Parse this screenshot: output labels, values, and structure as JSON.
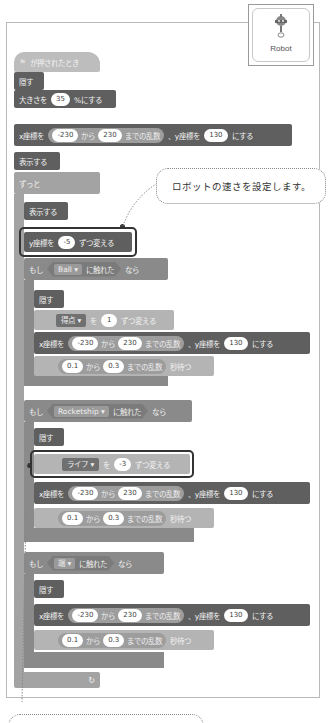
{
  "sprite": {
    "name": "Robot",
    "icon": "robot-icon"
  },
  "callout_top": {
    "text": "ロボットの速さを設定します。",
    "ruby": [
      "はや",
      "せってい"
    ]
  },
  "script": {
    "hat": {
      "flag_icon": "green-flag-icon",
      "label": "が押されたとき"
    },
    "hide1": "隠す",
    "size": {
      "label": "大きさを",
      "value": "35",
      "suffix": "%にする"
    },
    "goto1": {
      "x_label": "x座標を",
      "from": "-230",
      "kara": "から",
      "to": "230",
      "made": "までの乱数",
      "y_label": "、y座標を",
      "y": "130",
      "suffix": "にする"
    },
    "show1": "表示する",
    "forever": "ずっと",
    "show2": "表示する",
    "change_y": {
      "label": "y座標を",
      "value": "-5",
      "suffix": "ずつ変える"
    },
    "if1": {
      "moshi": "もし",
      "target": "Ball",
      "touching": "に触れた",
      "nara": "なら",
      "hide": "隠す",
      "change_var": {
        "var": "得点",
        "wo": "を",
        "value": "1",
        "suffix": "ずつ変える"
      },
      "goto": {
        "x_label": "x座標を",
        "from": "-230",
        "kara": "から",
        "to": "230",
        "made": "までの乱数",
        "y_label": "、y座標を",
        "y": "130",
        "suffix": "にする"
      },
      "wait": {
        "from": "0.1",
        "kara": "から",
        "to": "0.3",
        "made": "までの乱数",
        "suffix": "秒待つ"
      }
    },
    "if2": {
      "moshi": "もし",
      "target": "Rocketship",
      "touching": "に触れた",
      "nara": "なら",
      "hide": "隠す",
      "change_var": {
        "var": "ライフ",
        "wo": "を",
        "value": "-3",
        "suffix": "ずつ変える"
      },
      "goto": {
        "x_label": "x座標を",
        "from": "-230",
        "kara": "から",
        "to": "230",
        "made": "までの乱数",
        "y_label": "、y座標を",
        "y": "130",
        "suffix": "にする"
      },
      "wait": {
        "from": "0.1",
        "kara": "から",
        "to": "0.3",
        "made": "までの乱数",
        "suffix": "秒待つ"
      }
    },
    "if3": {
      "moshi": "もし",
      "target": "端",
      "touching": "に触れた",
      "nara": "なら",
      "hide": "隠す",
      "goto": {
        "x_label": "x座標を",
        "from": "-230",
        "kara": "から",
        "to": "230",
        "made": "までの乱数",
        "y_label": "、y座標を",
        "y": "130",
        "suffix": "にする"
      },
      "wait": {
        "from": "0.1",
        "kara": "から",
        "to": "0.3",
        "made": "までの乱数",
        "suffix": "秒待つ"
      }
    },
    "forever_end_icon": "loop-arrow-icon",
    "loop_glyph": "↻"
  }
}
